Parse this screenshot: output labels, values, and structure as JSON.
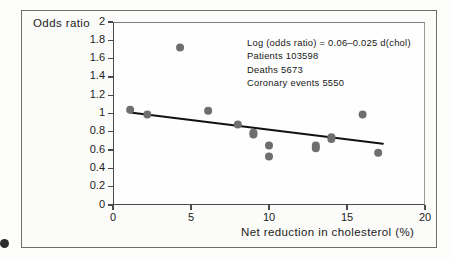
{
  "chart_data": {
    "type": "scatter",
    "title": "",
    "xlabel": "Net reduction in cholesterol (%)",
    "ylabel": "Odds ratio",
    "xlim": [
      0,
      20
    ],
    "ylim": [
      0,
      2
    ],
    "xticks": [
      "0",
      "5",
      "10",
      "15",
      "20"
    ],
    "xtick_values": [
      0,
      5,
      10,
      15,
      20
    ],
    "yticks": [
      "0",
      "0.2",
      "0.4",
      "0.6",
      "0.8",
      "1",
      "1.2",
      "1.4",
      "1.6",
      "1.8",
      "2"
    ],
    "ytick_values": [
      0,
      0.2,
      0.4,
      0.6,
      0.8,
      1,
      1.2,
      1.4,
      1.6,
      1.8,
      2
    ],
    "grid": false,
    "legend": "none",
    "marker_color": "#6e6e6e",
    "line_color": "#111111",
    "points": [
      {
        "x": 1.1,
        "y": 1.04
      },
      {
        "x": 2.2,
        "y": 0.99
      },
      {
        "x": 4.3,
        "y": 1.72
      },
      {
        "x": 6.1,
        "y": 1.03
      },
      {
        "x": 8.0,
        "y": 0.88
      },
      {
        "x": 9.0,
        "y": 0.79
      },
      {
        "x": 9.0,
        "y": 0.77
      },
      {
        "x": 10.0,
        "y": 0.65
      },
      {
        "x": 10.0,
        "y": 0.53
      },
      {
        "x": 13.0,
        "y": 0.65
      },
      {
        "x": 13.0,
        "y": 0.62
      },
      {
        "x": 14.0,
        "y": 0.74
      },
      {
        "x": 14.0,
        "y": 0.72
      },
      {
        "x": 16.0,
        "y": 0.99
      },
      {
        "x": 17.0,
        "y": 0.57
      }
    ],
    "fit_line": {
      "x_start": 1.1,
      "y_start": 1.01,
      "x_end": 17.3,
      "y_end": 0.67,
      "equation": "Log (odds ratio) = 0.06-0.025 d(chol)"
    },
    "annotations": [
      "Log (odds ratio)  =  0.06–0.025  d(chol)",
      "Patients  103598",
      "Deaths  5673",
      "Coronary  events  5550"
    ]
  },
  "figure": {
    "y_axis_title": "Odds ratio",
    "x_axis_title": "Net reduction in cholesterol (%)"
  }
}
